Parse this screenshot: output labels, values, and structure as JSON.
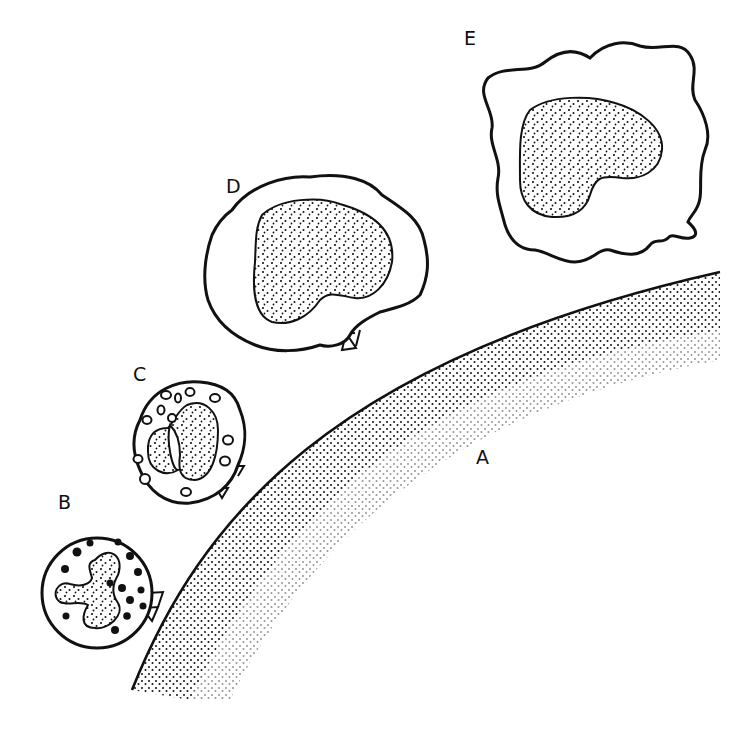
{
  "diagram": {
    "labels": {
      "A": "A",
      "B": "B",
      "C": "C",
      "D": "D",
      "E": "E"
    },
    "colors": {
      "ink": "#111111",
      "background": "#ffffff"
    },
    "elements": [
      {
        "id": "A",
        "description": "large stippled surface (target cell) with curved outer membrane"
      },
      {
        "id": "B",
        "description": "round cell with lobed stippled nucleus and dark solid granules, attached via two small junctions"
      },
      {
        "id": "C",
        "description": "round cell with bilobed stippled nucleus and hollow ring granules, attached via two small junctions"
      },
      {
        "id": "D",
        "description": "large irregular cell with kidney-shaped stippled nucleus, attached by a stalk with junction"
      },
      {
        "id": "E",
        "description": "large ruffled cell with kidney-shaped stippled nucleus, unattached"
      }
    ]
  }
}
